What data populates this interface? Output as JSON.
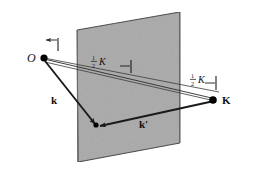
{
  "figure": {
    "background_color": "#ffffff",
    "plane": {
      "name": "scattering-plane",
      "fill_color": "#a8a8a8",
      "edge_color": "#3a3a3a",
      "corners": "77,30 180,12 180,143 78,162"
    },
    "colors": {
      "line": "#1a1a1a",
      "thin_line": "#444444",
      "point": "#000000",
      "plane_fill": "#a8a8a8",
      "plane_edge": "#3a3a3a"
    },
    "points": [
      {
        "id": "origin",
        "label": "O",
        "style": "italic",
        "x": 40,
        "y": 55
      },
      {
        "id": "k-end",
        "label": "K",
        "style": "bold",
        "x": 221,
        "y": 99
      },
      {
        "id": "scatter-vertex",
        "label": "",
        "style": "none",
        "x": 96,
        "y": 125
      }
    ],
    "labels": {
      "origin": "O",
      "k_vector": "k",
      "k_prime_vector": "k'",
      "K_vector": "K",
      "half_K_left": {
        "numerator": "1",
        "denominator": "2",
        "symbol": "K"
      },
      "half_K_right": {
        "numerator": "1",
        "denominator": "2",
        "symbol": "K"
      }
    },
    "vectors": [
      {
        "name": "incident-wavevector-k",
        "label": "k",
        "from": "origin",
        "to": "scatter-vertex"
      },
      {
        "name": "scattered-wavevector-k-prime",
        "label": "k'",
        "from": "K",
        "to": "scatter-vertex"
      },
      {
        "name": "scattering-vector-K",
        "label": "K",
        "from": "origin",
        "to": "K"
      }
    ],
    "annotations": {
      "half_K_left_text": "½K",
      "half_K_right_text": "½K",
      "midpoint_tick": "tick",
      "left_extent_tick": "tick",
      "right_extent_tick": "tick"
    }
  }
}
